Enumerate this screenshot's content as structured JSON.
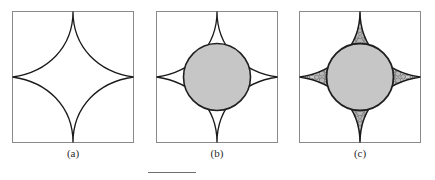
{
  "figure": {
    "panels": [
      {
        "id": "a",
        "caption": "(a)",
        "frame": {
          "x": 0.5,
          "y": 0.5,
          "width": 121,
          "height": 131
        },
        "astroid": {
          "center_x": 61,
          "center_y": 66,
          "radius_x": 60.5,
          "radius_y": 65.5
        },
        "has_inscribed_circle": false,
        "has_stipple": false
      },
      {
        "id": "b",
        "caption": "(b)",
        "frame": {
          "x": 0.5,
          "y": 0.5,
          "width": 121,
          "height": 131
        },
        "astroid": {
          "center_x": 61,
          "center_y": 66,
          "radius_x": 60.5,
          "radius_y": 65.5
        },
        "has_inscribed_circle": true,
        "inscribed_circle": {
          "cx": 61,
          "cy": 66,
          "r": 33.5
        },
        "has_stipple": false
      },
      {
        "id": "c",
        "caption": "(c)",
        "frame": {
          "x": 0.5,
          "y": 0.5,
          "width": 121,
          "height": 131
        },
        "astroid": {
          "center_x": 61,
          "center_y": 66,
          "radius_x": 60.5,
          "radius_y": 65.5
        },
        "has_inscribed_circle": true,
        "inscribed_circle": {
          "cx": 61,
          "cy": 66,
          "r": 33.5
        },
        "has_stipple": true,
        "stipple_note": "four cusp regions packed with small circles, sizes decreasing toward each cusp tip"
      }
    ],
    "footer_rule": {
      "x": 148,
      "y": 172,
      "width": 48
    }
  },
  "colors": {
    "background": "#ffffff",
    "frame_stroke": "#8a8a8a",
    "curve_stroke": "#1a1a1a",
    "circle_fill": "#c6c6c6",
    "circle_stroke": "#1f1f1f",
    "stipple_fill": "#b8b8b8",
    "stipple_region_fill": "#d2d2d2",
    "stipple_stroke": "#4a4a4a",
    "caption_text": "#2b2b2b",
    "footer_rule": "#6e6e6e"
  }
}
